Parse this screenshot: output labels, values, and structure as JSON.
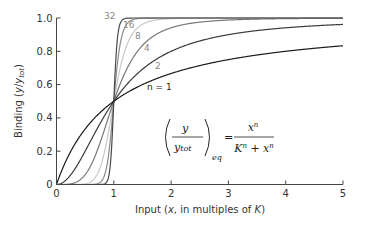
{
  "chart_data": {
    "type": "line",
    "title": "",
    "xlabel": "Input (x, in multiples of K)",
    "ylabel": "Binding (y/y_tot)",
    "xlim": [
      0,
      5
    ],
    "ylim": [
      0,
      1.0
    ],
    "x_ticks": [
      "0",
      "1",
      "2",
      "3",
      "4",
      "5"
    ],
    "y_ticks": [
      "0",
      "0.2",
      "0.4",
      "0.6",
      "0.8",
      "1.0"
    ],
    "grid": false,
    "legend": "inline labels",
    "function": "x^n / (K^n + x^n), K = 1",
    "series": [
      {
        "name": "n = 1",
        "n": 1,
        "label": "n = 1",
        "color": "#1a1a1a",
        "values_at_x": {
          "0": 0,
          "0.5": 0.333,
          "1": 0.5,
          "2": 0.667,
          "3": 0.75,
          "4": 0.8,
          "5": 0.833
        }
      },
      {
        "name": "2",
        "n": 2,
        "label": "2",
        "color": "#3a3a3a",
        "values_at_x": {
          "0": 0,
          "0.5": 0.2,
          "1": 0.5,
          "2": 0.8,
          "3": 0.9,
          "4": 0.941,
          "5": 0.962
        }
      },
      {
        "name": "4",
        "n": 4,
        "label": "4",
        "color": "#777777",
        "values_at_x": {
          "0": 0,
          "0.5": 0.059,
          "1": 0.5,
          "2": 0.941,
          "3": 0.988,
          "4": 0.996,
          "5": 0.998
        }
      },
      {
        "name": "8",
        "n": 8,
        "label": "8",
        "color": "#c8c8c8",
        "values_at_x": {
          "0": 0,
          "0.5": 0.004,
          "1": 0.5,
          "2": 0.996,
          "3": 1.0,
          "4": 1.0,
          "5": 1.0
        }
      },
      {
        "name": "16",
        "n": 16,
        "label": "16",
        "color": "#8a8a8a",
        "values_at_x": {
          "0": 0,
          "0.5": 0.0,
          "1": 0.5,
          "2": 1.0,
          "3": 1.0,
          "4": 1.0,
          "5": 1.0
        }
      },
      {
        "name": "32",
        "n": 32,
        "label": "32",
        "color": "#4a4a4a",
        "values_at_x": {
          "0": 0,
          "0.5": 0.0,
          "1": 0.5,
          "2": 1.0,
          "3": 1.0,
          "4": 1.0,
          "5": 1.0
        }
      }
    ],
    "annotations": [
      {
        "text": "(y / y_tot)_eq = x^n / (K^n + x^n)"
      }
    ]
  },
  "labels": {
    "xlabel_prefix": "Input (",
    "xlabel_var": "x",
    "xlabel_mid": ", in multiples of ",
    "xlabel_K": "K",
    "xlabel_suffix": ")",
    "ylabel_prefix": "Binding (",
    "ylabel_y": "y",
    "ylabel_slash": "/",
    "ylabel_y2": "y",
    "ylabel_sub": "tot",
    "ylabel_suffix": ")"
  },
  "equation": {
    "lhs_num": "y",
    "lhs_den": "y",
    "lhs_den_sub": "tot",
    "lhs_sub": "eq",
    "equals": "=",
    "rhs_num": "x",
    "rhs_num_exp": "n",
    "rhs_den_a": "K",
    "rhs_den_a_exp": "n",
    "rhs_den_plus": " + ",
    "rhs_den_b": "x",
    "rhs_den_b_exp": "n"
  }
}
